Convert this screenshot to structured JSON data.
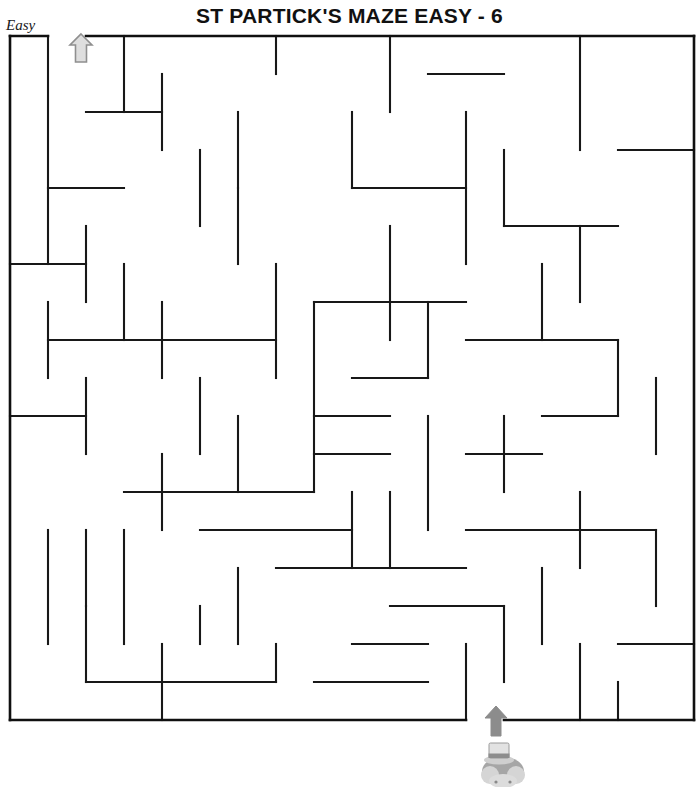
{
  "page": {
    "title": "ST PARTICK'S MAZE EASY - 6",
    "difficulty_label": "Easy",
    "background_color": "#ffffff",
    "wall_color": "#181818",
    "entrance_arrow_color": "#d9d9d9",
    "entrance_arrow_outline": "#8a8a8a",
    "exit_arrow_color": "#8c8c8c",
    "figure_color": "#9d9d9d",
    "figure_name": "leprechaun-with-top-hat"
  },
  "maze": {
    "type": "orthogonal-grid-maze",
    "columns": 18,
    "rows": 18,
    "cell_size": 38,
    "origin_x": 10,
    "origin_y": 36,
    "entrance": {
      "side": "top",
      "col": 1,
      "label": "Easy",
      "marker": "up-arrow-outline"
    },
    "exit": {
      "side": "bottom",
      "col": 12,
      "marker": "up-arrow-solid"
    },
    "border_segments": [
      [
        0,
        0,
        1,
        0
      ],
      [
        2,
        0,
        18,
        0
      ],
      [
        0,
        0,
        0,
        18
      ],
      [
        18,
        0,
        18,
        18
      ],
      [
        0,
        18,
        12,
        18
      ],
      [
        13,
        18,
        18,
        18
      ]
    ],
    "wall_segments": [
      [
        1,
        0,
        1,
        6
      ],
      [
        3,
        0,
        3,
        2
      ],
      [
        7,
        0,
        7,
        1
      ],
      [
        10,
        0,
        10,
        2
      ],
      [
        15,
        0,
        15,
        3
      ],
      [
        4,
        1,
        4,
        3
      ],
      [
        11,
        1,
        13,
        1
      ],
      [
        2,
        2,
        4,
        2
      ],
      [
        9,
        2,
        9,
        4
      ],
      [
        12,
        2,
        12,
        6
      ],
      [
        5,
        3,
        5,
        5
      ],
      [
        13,
        3,
        13,
        5
      ],
      [
        16,
        3,
        18,
        3
      ],
      [
        1,
        4,
        3,
        4
      ],
      [
        6,
        4,
        6,
        6
      ],
      [
        9,
        4,
        12,
        4
      ],
      [
        2,
        5,
        2,
        7
      ],
      [
        10,
        5,
        10,
        8
      ],
      [
        15,
        5,
        15,
        7
      ],
      [
        13,
        5,
        16,
        5
      ],
      [
        0,
        6,
        2,
        6
      ],
      [
        3,
        6,
        3,
        8
      ],
      [
        7,
        6,
        7,
        9
      ],
      [
        8,
        7,
        8,
        12
      ],
      [
        11,
        7,
        11,
        9
      ],
      [
        1,
        7,
        1,
        9
      ],
      [
        4,
        7,
        4,
        9
      ],
      [
        8,
        7,
        12,
        7
      ],
      [
        1,
        8,
        7,
        8
      ],
      [
        12,
        8,
        16,
        8
      ],
      [
        16,
        8,
        16,
        10
      ],
      [
        2,
        9,
        2,
        11
      ],
      [
        5,
        9,
        5,
        11
      ],
      [
        9,
        9,
        11,
        9
      ],
      [
        8,
        10,
        10,
        10
      ],
      [
        13,
        10,
        13,
        12
      ],
      [
        17,
        9,
        17,
        11
      ],
      [
        0,
        10,
        2,
        10
      ],
      [
        6,
        10,
        6,
        12
      ],
      [
        11,
        10,
        11,
        13
      ],
      [
        14,
        10,
        16,
        10
      ],
      [
        4,
        11,
        4,
        13
      ],
      [
        8,
        11,
        10,
        11
      ],
      [
        3,
        12,
        8,
        12
      ],
      [
        12,
        11,
        14,
        11
      ],
      [
        15,
        12,
        15,
        14
      ],
      [
        1,
        13,
        1,
        16
      ],
      [
        9,
        12,
        9,
        14
      ],
      [
        5,
        13,
        9,
        13
      ],
      [
        12,
        13,
        17,
        13
      ],
      [
        17,
        13,
        17,
        15
      ],
      [
        3,
        13,
        3,
        16
      ],
      [
        6,
        14,
        6,
        16
      ],
      [
        7,
        14,
        12,
        14
      ],
      [
        10,
        15,
        13,
        15
      ],
      [
        2,
        15,
        2,
        17
      ],
      [
        5,
        15,
        5,
        16
      ],
      [
        13,
        15,
        13,
        17
      ],
      [
        14,
        14,
        14,
        16
      ],
      [
        4,
        16,
        4,
        18
      ],
      [
        7,
        16,
        7,
        17
      ],
      [
        9,
        16,
        11,
        16
      ],
      [
        12,
        16,
        12,
        18
      ],
      [
        15,
        16,
        15,
        18
      ],
      [
        16,
        16,
        18,
        16
      ],
      [
        5,
        17,
        7,
        17
      ],
      [
        8,
        17,
        11,
        17
      ],
      [
        2,
        17,
        5,
        17
      ],
      [
        16,
        17,
        16,
        18
      ],
      [
        10,
        12,
        10,
        14
      ],
      [
        14,
        6,
        14,
        8
      ],
      [
        6,
        2,
        6,
        4
      ],
      [
        2,
        13,
        2,
        15
      ]
    ]
  }
}
